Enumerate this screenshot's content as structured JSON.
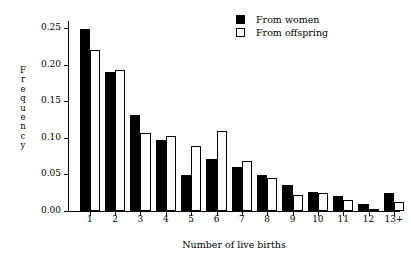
{
  "chart_data": {
    "type": "bar",
    "title": "",
    "subtitle": "",
    "xlabel": "Number of live births",
    "ylabel": "Frequency",
    "categories": [
      "1",
      "2",
      "3",
      "4",
      "5",
      "6",
      "7",
      "8",
      "9",
      "10",
      "11",
      "12",
      "13+"
    ],
    "series": [
      {
        "name": "From women",
        "color": "#000000",
        "style": "filled",
        "values": [
          0.249,
          0.19,
          0.131,
          0.097,
          0.049,
          0.071,
          0.06,
          0.049,
          0.035,
          0.026,
          0.02,
          0.01,
          0.025
        ]
      },
      {
        "name": "From offspring",
        "color": "#ffffff",
        "style": "open",
        "values": [
          0.221,
          0.193,
          0.107,
          0.103,
          0.089,
          0.11,
          0.069,
          0.045,
          0.022,
          0.024,
          0.015,
          0.002,
          0.012
        ]
      }
    ],
    "ylim": [
      0.0,
      0.26
    ],
    "yticks": [
      0.0,
      0.05,
      0.1,
      0.15,
      0.2,
      0.25
    ],
    "ytick_labels": [
      "0.00",
      "0.05",
      "0.10",
      "0.15",
      "0.20",
      "0.25"
    ],
    "grid": false,
    "legend_position": "top-right",
    "legend_entries": [
      "From women",
      "From offspring"
    ]
  },
  "axes": {
    "ylabel_letters": [
      "F",
      "r",
      "e",
      "q",
      "u",
      "e",
      "n",
      "c",
      "y"
    ]
  },
  "legend": {
    "women_label": "From women",
    "offspring_label": "From offspring"
  }
}
